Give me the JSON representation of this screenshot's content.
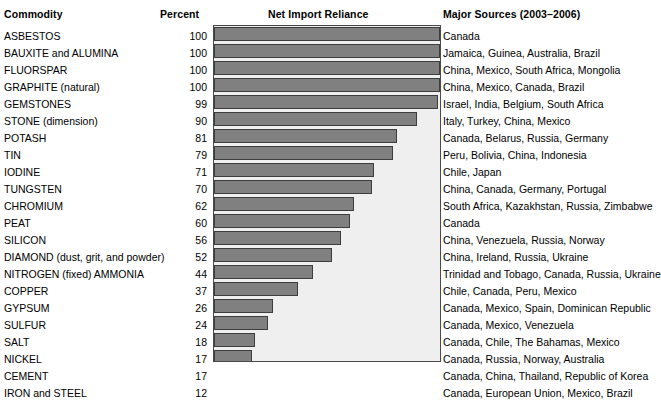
{
  "headers": {
    "commodity": "Commodity",
    "percent": "Percent",
    "chart": "Net Import Reliance",
    "sources": "Major Sources (2003–2006)"
  },
  "style": {
    "bar_fill": "#808080",
    "bar_border": "#3d3d3d",
    "plot_background": "#efefef",
    "plot_border": "#4a4a4a",
    "text_color": "#000000",
    "page_background": "#ffffff"
  },
  "rows": [
    {
      "commodity": "ASBESTOS",
      "percent": 100,
      "sources": "Canada"
    },
    {
      "commodity": "BAUXITE and ALUMINA",
      "percent": 100,
      "sources": "Jamaica, Guinea, Australia, Brazil"
    },
    {
      "commodity": "FLUORSPAR",
      "percent": 100,
      "sources": "China, Mexico, South Africa, Mongolia"
    },
    {
      "commodity": "GRAPHITE (natural)",
      "percent": 100,
      "sources": "China, Mexico, Canada, Brazil"
    },
    {
      "commodity": "GEMSTONES",
      "percent": 99,
      "sources": "Israel, India, Belgium, South Africa"
    },
    {
      "commodity": "STONE (dimension)",
      "percent": 90,
      "sources": "Italy, Turkey, China, Mexico"
    },
    {
      "commodity": "POTASH",
      "percent": 81,
      "sources": "Canada, Belarus, Russia, Germany"
    },
    {
      "commodity": "TIN",
      "percent": 79,
      "sources": "Peru, Bolivia, China, Indonesia"
    },
    {
      "commodity": "IODINE",
      "percent": 71,
      "sources": "Chile, Japan"
    },
    {
      "commodity": "TUNGSTEN",
      "percent": 70,
      "sources": "China, Canada, Germany, Portugal"
    },
    {
      "commodity": "CHROMIUM",
      "percent": 62,
      "sources": "South Africa, Kazakhstan, Russia, Zimbabwe"
    },
    {
      "commodity": "PEAT",
      "percent": 60,
      "sources": "Canada"
    },
    {
      "commodity": "SILICON",
      "percent": 56,
      "sources": "China, Venezuela, Russia, Norway"
    },
    {
      "commodity": "DIAMOND (dust, grit, and powder)",
      "percent": 52,
      "sources": "China, Ireland, Russia, Ukraine"
    },
    {
      "commodity": "NITROGEN (fixed) AMMONIA",
      "percent": 44,
      "sources": "Trinidad and Tobago, Canada, Russia, Ukraine"
    },
    {
      "commodity": "COPPER",
      "percent": 37,
      "sources": "Chile, Canada, Peru, Mexico"
    },
    {
      "commodity": "GYPSUM",
      "percent": 26,
      "sources": "Canada, Mexico, Spain, Dominican Republic"
    },
    {
      "commodity": "SULFUR",
      "percent": 24,
      "sources": "Canada, Mexico, Venezuela"
    },
    {
      "commodity": "SALT",
      "percent": 18,
      "sources": "Canada, Chile, The Bahamas, Mexico"
    },
    {
      "commodity": "NICKEL",
      "percent": 17,
      "sources": "Canada, Russia, Norway, Australia"
    },
    {
      "commodity": "CEMENT",
      "percent": 17,
      "sources": "Canada, China, Thailand, Republic of Korea"
    },
    {
      "commodity": "IRON and STEEL",
      "percent": 12,
      "sources": "Canada, European Union, Mexico, Brazil"
    }
  ],
  "chart_data": {
    "type": "bar",
    "title": "Net Import Reliance",
    "orientation": "horizontal",
    "xlabel": "Percent",
    "ylabel": "Commodity",
    "xlim": [
      0,
      100
    ],
    "grid": false,
    "legend": null,
    "categories": [
      "ASBESTOS",
      "BAUXITE and ALUMINA",
      "FLUORSPAR",
      "GRAPHITE (natural)",
      "GEMSTONES",
      "STONE (dimension)",
      "POTASH",
      "TIN",
      "IODINE",
      "TUNGSTEN",
      "CHROMIUM",
      "PEAT",
      "SILICON",
      "DIAMOND (dust, grit, and powder)",
      "NITROGEN (fixed) AMMONIA",
      "COPPER",
      "GYPSUM",
      "SULFUR",
      "SALT",
      "NICKEL",
      "CEMENT",
      "IRON and STEEL"
    ],
    "values": [
      100,
      100,
      100,
      100,
      99,
      90,
      81,
      79,
      71,
      70,
      62,
      60,
      56,
      52,
      44,
      37,
      26,
      24,
      18,
      17,
      17,
      12
    ]
  }
}
